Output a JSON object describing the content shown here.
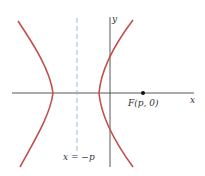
{
  "diagram": {
    "type": "hyperbola",
    "colors": {
      "curve": "#c0504d",
      "axes": "#444444",
      "directrix": "#8fb3d9",
      "focus": "#111111"
    },
    "labels": {
      "x_axis": "x",
      "y_axis": "y",
      "focus": "F(p, 0)",
      "directrix": "x = −p"
    }
  }
}
